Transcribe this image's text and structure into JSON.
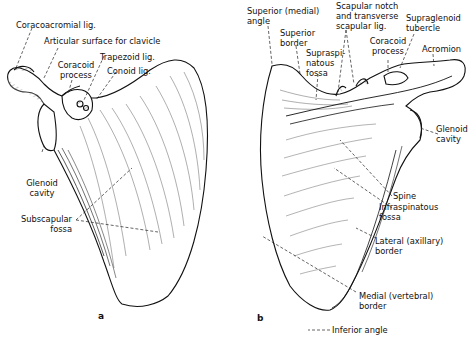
{
  "figure": {
    "panels": [
      {
        "id": "a",
        "label": "a",
        "view": "anterior (costal) surface"
      },
      {
        "id": "b",
        "label": "b",
        "view": "posterior (dorsal) surface"
      }
    ],
    "panel_a_labels": {
      "coracoacromial": "Coracoacromial lig.",
      "articular_surface": "Articular surface for clavicle",
      "coracoid_1": "Coracoid",
      "coracoid_2": "process",
      "trapezoid": "Trapezoid lig.",
      "conoid": "Conoid lig.",
      "glenoid_1": "Glenoid",
      "glenoid_2": "cavity",
      "subscapular_1": "Subscapular",
      "subscapular_2": "fossa"
    },
    "panel_b_labels": {
      "superior_angle_1": "Superior (medial)",
      "superior_angle_2": "angle",
      "superior_border_1": "Superior",
      "superior_border_2": "border",
      "supraspinatous_1": "Supraspi-",
      "supraspinatous_2": "natous",
      "supraspinatous_3": "fossa",
      "scapular_notch_1": "Scapular notch",
      "scapular_notch_2": "and transverse",
      "scapular_notch_3": "scapular lig.",
      "coracoid_1": "Coracoid",
      "coracoid_2": "process",
      "supraglenoid_1": "Supraglenoid",
      "supraglenoid_2": "tubercle",
      "acromion": "Acromion",
      "glenoid_1": "Glenoid",
      "glenoid_2": "cavity",
      "spine": "Spine",
      "infraspinatous_1": "Infraspinatous",
      "infraspinatous_2": "fossa",
      "lateral_border_1": "Lateral (axillary)",
      "lateral_border_2": "border",
      "medial_border_1": "Medial (vertebral)",
      "medial_border_2": "border",
      "inferior_angle": "Inferior angle"
    },
    "colors": {
      "ink": "#111111",
      "background": "#ffffff"
    }
  }
}
